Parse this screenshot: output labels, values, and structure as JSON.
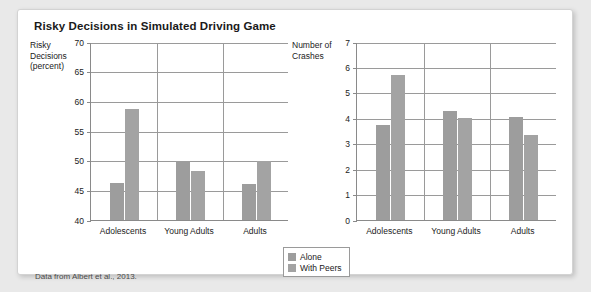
{
  "figure": {
    "title": "Risky Decisions in Simulated Driving Game",
    "source_note": "Data from Albert et al., 2013."
  },
  "legend": {
    "items": [
      {
        "label": "Alone",
        "color": "#9d9d9d"
      },
      {
        "label": "With Peers",
        "color": "#a3a3a3"
      }
    ]
  },
  "chart_data": [
    {
      "type": "bar",
      "title": "Risky Decisions in Simulated Driving Game",
      "panel": "left",
      "xlabel": "",
      "ylabel": "Risky\nDecisions\n(percent)",
      "ylim": [
        40,
        70
      ],
      "yticks": [
        40,
        45,
        50,
        55,
        60,
        65,
        70
      ],
      "ytick_labels": [
        "40",
        "45",
        "50",
        "55",
        "60",
        "65",
        "70"
      ],
      "grid": true,
      "legend_position": "below-center",
      "categories": [
        "Adolescents",
        "Young Adults",
        "Adults"
      ],
      "series": [
        {
          "name": "Alone",
          "values": [
            46.3,
            50.0,
            46.1
          ]
        },
        {
          "name": "With Peers",
          "values": [
            58.7,
            48.2,
            50.0
          ]
        }
      ]
    },
    {
      "type": "bar",
      "panel": "right",
      "title": "",
      "xlabel": "",
      "ylabel": "Number of\nCrashes",
      "ylim": [
        0,
        7
      ],
      "yticks": [
        0,
        1,
        2,
        3,
        4,
        5,
        6,
        7
      ],
      "ytick_labels": [
        "0",
        "1",
        "2",
        "3",
        "4",
        "5",
        "6",
        "7"
      ],
      "grid": true,
      "legend_position": "below-center",
      "categories": [
        "Adolescents",
        "Young Adults",
        "Adults"
      ],
      "series": [
        {
          "name": "Alone",
          "values": [
            3.75,
            4.3,
            4.05
          ]
        },
        {
          "name": "With Peers",
          "values": [
            5.7,
            4.0,
            3.35
          ]
        }
      ]
    }
  ]
}
